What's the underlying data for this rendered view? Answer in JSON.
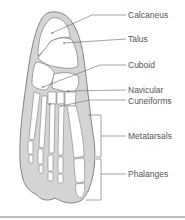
{
  "diagram": {
    "colors": {
      "outline": "#6a6a6a",
      "skin_fill": "#d4d4d4",
      "bone_fill": "#ffffff",
      "leader": "#666666",
      "label_text": "#555555",
      "rule": "#bcbcbc"
    },
    "labels": [
      {
        "id": "calcaneus",
        "text": "Calcaneus",
        "y": 10
      },
      {
        "id": "talus",
        "text": "Talus",
        "y": 34
      },
      {
        "id": "cuboid",
        "text": "Cuboid",
        "y": 57
      },
      {
        "id": "navicular",
        "text": "Navicular",
        "y": 83
      },
      {
        "id": "cuneiforms",
        "text": "Cuneiforms",
        "y": 96
      },
      {
        "id": "metatarsals",
        "text": "Metatarsals",
        "y": 120
      },
      {
        "id": "phalanges",
        "text": "Phalanges",
        "y": 159
      }
    ]
  }
}
